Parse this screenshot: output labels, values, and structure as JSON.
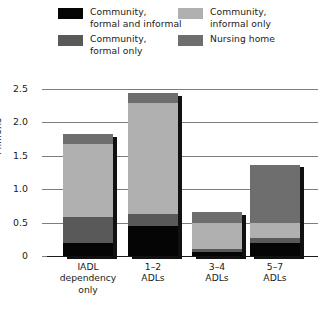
{
  "chart_data": {
    "type": "bar",
    "subtype": "stacked",
    "title": "",
    "xlabel": "",
    "ylabel": "Millions",
    "ylim": [
      0,
      2.5
    ],
    "yticks": [
      "0",
      "0.5",
      "1.0",
      "1.5",
      "2.0",
      "2.5"
    ],
    "ytick_values": [
      0,
      0.5,
      1.0,
      1.5,
      2.0,
      2.5
    ],
    "grid": true,
    "legend_position": "top",
    "categories": [
      "IADL\ndependency\nonly",
      "1–2\nADLs",
      "3–4\nADLs",
      "5–7\nADLs"
    ],
    "series": [
      {
        "name": "Community,\nformal and informal",
        "color": "#050505",
        "values": [
          0.19,
          0.45,
          0.06,
          0.19
        ]
      },
      {
        "name": "Community,\nformal only",
        "color": "#595959",
        "values": [
          0.39,
          0.18,
          0.05,
          0.08
        ]
      },
      {
        "name": "Community,\ninformal only",
        "color": "#b0b0b0",
        "values": [
          1.09,
          1.66,
          0.39,
          0.23
        ]
      },
      {
        "name": "Nursing home",
        "color": "#6e6e6e",
        "values": [
          0.15,
          0.15,
          0.16,
          0.87
        ]
      }
    ],
    "totals": [
      1.82,
      2.44,
      0.66,
      1.37
    ]
  },
  "legend": {
    "items": [
      {
        "label": "Community,\nformal and informal",
        "color": "#050505",
        "row": 0,
        "col": 0
      },
      {
        "label": "Community,\nformal only",
        "color": "#595959",
        "row": 1,
        "col": 0
      },
      {
        "label": "Community,\ninformal only",
        "color": "#b0b0b0",
        "row": 0,
        "col": 1
      },
      {
        "label": "Nursing home",
        "color": "#6e6e6e",
        "row": 1,
        "col": 1
      }
    ]
  }
}
